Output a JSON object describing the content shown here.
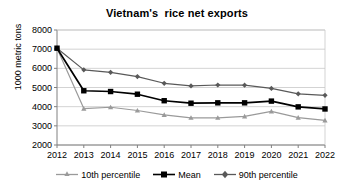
{
  "chart_data": {
    "type": "line",
    "title": "Vietnam's  rice net exports",
    "xlabel": "",
    "ylabel": "1000 metric tons",
    "categories": [
      "2012",
      "2013",
      "2014",
      "2015",
      "2016",
      "2017",
      "2018",
      "2019",
      "2020",
      "2021",
      "2022"
    ],
    "x": [
      2012,
      2013,
      2014,
      2015,
      2016,
      2017,
      2018,
      2019,
      2020,
      2021,
      2022
    ],
    "xlim": [
      2012,
      2022
    ],
    "ylim": [
      2000,
      8000
    ],
    "yticks": [
      2000,
      3000,
      4000,
      5000,
      6000,
      7000,
      8000
    ],
    "ytick_labels": [
      "2000",
      "3000",
      "4000",
      "5000",
      "6000",
      "7000",
      "8000"
    ],
    "grid": "horizontal",
    "legend_position": "bottom",
    "series": [
      {
        "name": "10th percentile",
        "color": "#9a9a9a",
        "marker": "triangle",
        "values": [
          7050,
          3900,
          3970,
          3800,
          3570,
          3420,
          3420,
          3490,
          3750,
          3430,
          3280
        ]
      },
      {
        "name": "Mean",
        "color": "#000000",
        "marker": "square",
        "values": [
          7050,
          4830,
          4790,
          4650,
          4310,
          4180,
          4200,
          4200,
          4290,
          3990,
          3880
        ]
      },
      {
        "name": "90th percentile",
        "color": "#595959",
        "marker": "diamond",
        "values": [
          7050,
          5920,
          5790,
          5570,
          5220,
          5080,
          5130,
          5120,
          4950,
          4670,
          4590
        ]
      }
    ]
  },
  "legend": {
    "items": [
      {
        "label": "10th percentile"
      },
      {
        "label": "Mean"
      },
      {
        "label": "90th percentile"
      }
    ]
  },
  "colors": {
    "p10": "#9a9a9a",
    "mean": "#000000",
    "p90": "#595959",
    "grid": "#c8c8c8",
    "axis": "#808080",
    "background": "#ffffff",
    "text": "#000000"
  }
}
